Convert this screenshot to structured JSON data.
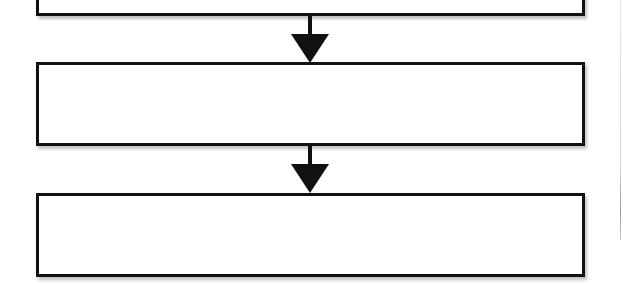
{
  "diagram": {
    "type": "vertical-flowchart",
    "stroke_color": "#111111",
    "fill_color": "#ffffff",
    "boxes": [
      {
        "id": "box1",
        "label": ""
      },
      {
        "id": "box2",
        "label": ""
      },
      {
        "id": "box3",
        "label": ""
      }
    ],
    "arrows": [
      {
        "from": "box1",
        "to": "box2",
        "direction": "down"
      },
      {
        "from": "box2",
        "to": "box3",
        "direction": "down"
      }
    ]
  }
}
